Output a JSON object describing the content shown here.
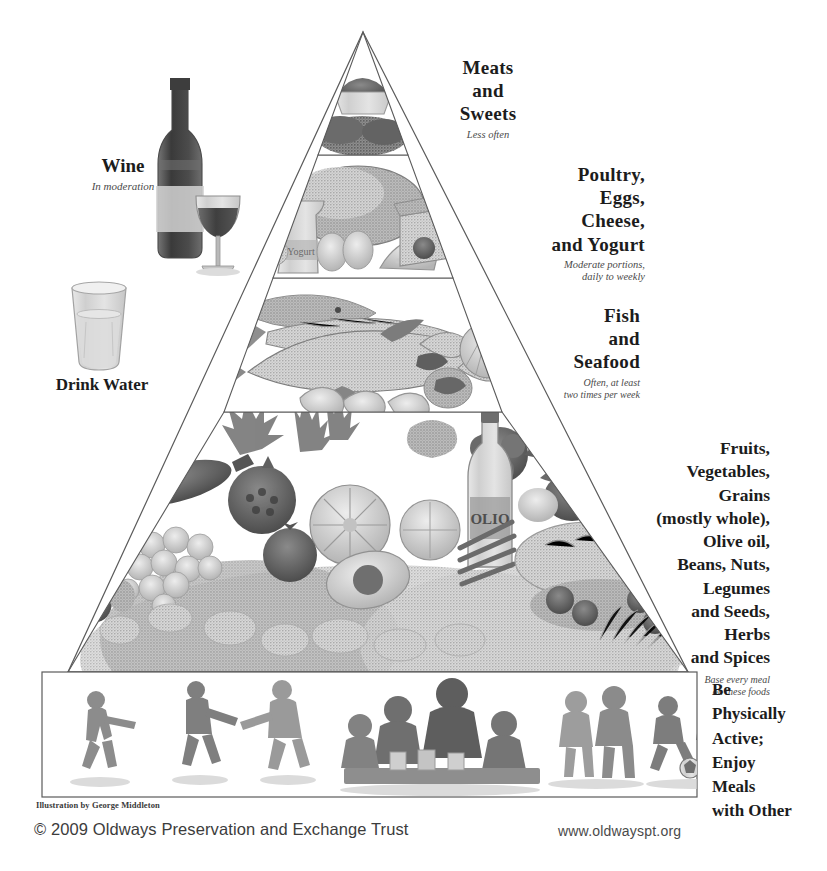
{
  "poster": {
    "title": "Mediterranean Diet Pyramid",
    "background_color": "#ffffff",
    "line_color": "#5b5b5b"
  },
  "tiers": [
    {
      "id": "meats-and-sweets",
      "title": "Meats\nand\nSweets",
      "subtitle": "Less often",
      "illustration": "meats-and-sweets-illustration"
    },
    {
      "id": "poultry-eggs-cheese-yogurt",
      "title": "Poultry,\nEggs,\nCheese,\nand Yogurt",
      "subtitle": "Moderate portions,\ndaily to weekly",
      "illustration": "poultry-eggs-cheese-yogurt-illustration"
    },
    {
      "id": "fish-and-seafood",
      "title": "Fish\nand\nSeafood",
      "subtitle": "Often, at least\ntwo times per week",
      "illustration": "fish-and-seafood-illustration"
    },
    {
      "id": "plant-foods-base",
      "title": "Fruits,\nVegetables,\nGrains\n(mostly whole),\nOlive oil,\nBeans, Nuts,\nLegumes\nand Seeds,\nHerbs\nand Spices",
      "subtitle": "Base every meal\non these foods",
      "illustration": "fruits-vegetables-grains-illustration"
    }
  ],
  "base_band": {
    "id": "be-physically-active",
    "title": "Be\nPhysically\nActive;\nEnjoy\nMeals\nwith Other",
    "illustration": "people-dancing-eating-walking-playing-illustration"
  },
  "side_callouts": [
    {
      "id": "wine",
      "title": "Wine",
      "subtitle": "In moderation",
      "illustration": "wine-bottle-and-glass-illustration"
    },
    {
      "id": "drink-water",
      "title": "Drink Water",
      "subtitle": "",
      "illustration": "water-glass-illustration"
    }
  ],
  "footer": {
    "credit": "Illustration by George Middleton",
    "copyright": "© 2009 Oldways Preservation and Exchange Trust",
    "website": "www.oldwayspt.org"
  }
}
